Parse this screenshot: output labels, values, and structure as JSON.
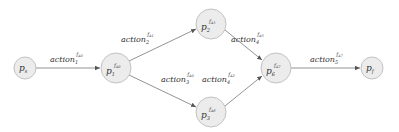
{
  "diagram": {
    "type": "directed-graph",
    "nodes": [
      {
        "id": "ps",
        "base": "p",
        "sub": "s",
        "sup": "",
        "cx": 25,
        "cy": 68,
        "r": 11
      },
      {
        "id": "p1",
        "base": "p",
        "sub": "1",
        "sup": "f",
        "sup_sub": "A0",
        "cx": 116,
        "cy": 68,
        "r": 15
      },
      {
        "id": "p2",
        "base": "p",
        "sub": "2",
        "sup": "f",
        "sup_sub": "A5",
        "cx": 211,
        "cy": 24,
        "r": 15
      },
      {
        "id": "p3",
        "base": "p",
        "sub": "3",
        "sup": "f",
        "sup_sub": "A6",
        "cx": 211,
        "cy": 112,
        "r": 15
      },
      {
        "id": "p6",
        "base": "p",
        "sub": "6",
        "sup": "f",
        "sup_sub": "A7",
        "cx": 276,
        "cy": 68,
        "r": 15
      },
      {
        "id": "pf",
        "base": "p",
        "sub": "f",
        "sup": "",
        "cx": 372,
        "cy": 68,
        "r": 11
      }
    ],
    "edges": [
      {
        "from": "ps",
        "to": "p1",
        "label": {
          "base": "action",
          "sub": "1",
          "sup": "f",
          "sup_sub": "A0"
        }
      },
      {
        "from": "p1",
        "to": "p2",
        "label": {
          "base": "action",
          "sub": "2",
          "sup": "f",
          "sup_sub": "A1"
        }
      },
      {
        "from": "p1",
        "to": "p3",
        "label": {
          "base": "action",
          "sub": "3",
          "sup": "f",
          "sup_sub": "A0"
        }
      },
      {
        "from": "p2",
        "to": "p6",
        "label": {
          "base": "action",
          "sub": "4",
          "sup": "f",
          "sup_sub": "A5"
        }
      },
      {
        "from": "p3",
        "to": "p6",
        "label": {
          "base": "action",
          "sub": "4",
          "sup": "f",
          "sup_sub": "A2"
        }
      },
      {
        "from": "p6",
        "to": "pf",
        "label": {
          "base": "action",
          "sub": "5",
          "sup": "f",
          "sup_sub": "A7"
        }
      }
    ]
  },
  "labels": {
    "node_ps": {
      "base": "p",
      "sub": "s"
    },
    "node_p1": {
      "base": "p",
      "sub": "1",
      "sup": "f",
      "supsub": "A0"
    },
    "node_p2": {
      "base": "p",
      "sub": "2",
      "sup": "f",
      "supsub": "A5"
    },
    "node_p3": {
      "base": "p",
      "sub": "3",
      "sup": "f",
      "supsub": "A6"
    },
    "node_p6": {
      "base": "p",
      "sub": "6",
      "sup": "f",
      "supsub": "A7"
    },
    "node_pf": {
      "base": "p",
      "sub": "f"
    },
    "edge_1": {
      "base": "action",
      "sub": "1",
      "sup": "f",
      "supsub": "A0"
    },
    "edge_2": {
      "base": "action",
      "sub": "2",
      "sup": "f",
      "supsub": "A1"
    },
    "edge_3": {
      "base": "action",
      "sub": "3",
      "sup": "f",
      "supsub": "A0"
    },
    "edge_4a": {
      "base": "action",
      "sub": "4",
      "sup": "f",
      "supsub": "A5"
    },
    "edge_4b": {
      "base": "action",
      "sub": "4",
      "sup": "f",
      "supsub": "A2"
    },
    "edge_5": {
      "base": "action",
      "sub": "5",
      "sup": "f",
      "supsub": "A7"
    }
  },
  "colors": {
    "node_fill": "#ececec",
    "node_stroke": "#c2c2c2",
    "edge": "#777777",
    "text": "#333333"
  }
}
